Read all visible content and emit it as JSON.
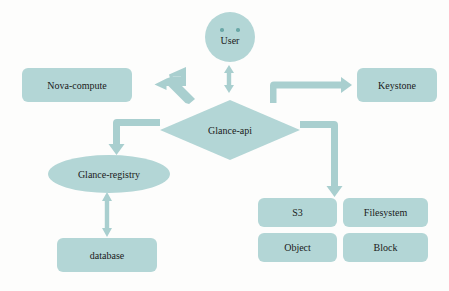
{
  "diagram": {
    "colors": {
      "node_fill": "#b3d6d6",
      "arrow_fill": "#a9cfcf",
      "text": "#1a1a1a",
      "background": "#fdfdfc"
    },
    "nodes": [
      {
        "id": "user",
        "label": "User",
        "shape": "circle"
      },
      {
        "id": "nova-compute",
        "label": "Nova-compute",
        "shape": "rounded-rect"
      },
      {
        "id": "keystone",
        "label": "Keystone",
        "shape": "rounded-rect"
      },
      {
        "id": "glance-api",
        "label": "Glance-api",
        "shape": "diamond"
      },
      {
        "id": "glance-registry",
        "label": "Glance-registry",
        "shape": "ellipse"
      },
      {
        "id": "database",
        "label": "database",
        "shape": "rounded-rect"
      },
      {
        "id": "s3",
        "label": "S3",
        "shape": "rounded-rect"
      },
      {
        "id": "filesystem",
        "label": "Filesystem",
        "shape": "rounded-rect"
      },
      {
        "id": "object",
        "label": "Object",
        "shape": "rounded-rect"
      },
      {
        "id": "block",
        "label": "Block",
        "shape": "rounded-rect"
      }
    ],
    "connectors": [
      {
        "id": "user-to-glance-api",
        "from": "user",
        "to": "glance-api",
        "style": "double-headed-vertical"
      },
      {
        "id": "glance-api-to-nova-compute",
        "from": "glance-api",
        "to": "nova-compute",
        "style": "bent-diagonal-left"
      },
      {
        "id": "glance-api-to-keystone",
        "from": "glance-api",
        "to": "keystone",
        "style": "elbow-up-right"
      },
      {
        "id": "glance-api-to-glance-registry",
        "from": "glance-api",
        "to": "glance-registry",
        "style": "elbow-left-down"
      },
      {
        "id": "glance-api-to-stores",
        "from": "glance-api",
        "to": "s3",
        "style": "elbow-right-down"
      },
      {
        "id": "glance-registry-to-database",
        "from": "glance-registry",
        "to": "database",
        "style": "double-headed-vertical"
      }
    ]
  }
}
